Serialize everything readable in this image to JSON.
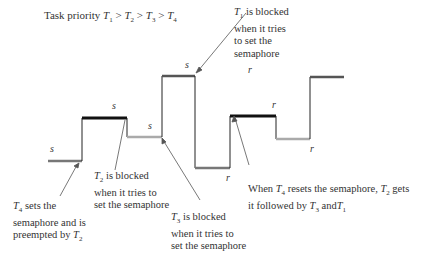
{
  "title": "Task priority T1 > T2 > T3 > T4",
  "colors": {
    "T1": "#555555",
    "T2": "#111111",
    "T3": "#aaaaaa",
    "T4": "#777777",
    "line": "#222222"
  },
  "segments": [
    {
      "task": "T4",
      "x1": 48,
      "x2": 82,
      "y": 161,
      "label": "s",
      "lx": 50,
      "ly": 143
    },
    {
      "task": "T2",
      "x1": 82,
      "x2": 127,
      "y": 118,
      "label": "s",
      "lx": 112,
      "ly": 100
    },
    {
      "task": "T3",
      "x1": 127,
      "x2": 162,
      "y": 137,
      "label": "s",
      "lx": 148,
      "ly": 120
    },
    {
      "task": "T1",
      "x1": 162,
      "x2": 195,
      "y": 76,
      "label": "s",
      "lx": 185,
      "ly": 59
    },
    {
      "task": "T4",
      "x1": 195,
      "x2": 230,
      "y": 168,
      "label": "r",
      "lx": 226,
      "ly": 172
    },
    {
      "task": "T2",
      "x1": 230,
      "x2": 276,
      "y": 116,
      "label": "r",
      "lx": 272,
      "ly": 99
    },
    {
      "task": "T3",
      "x1": 276,
      "x2": 310,
      "y": 139,
      "label": "r",
      "lx": 310,
      "ly": 143
    },
    {
      "task": "T1",
      "x1": 310,
      "x2": 344,
      "y": 77,
      "label": "r",
      "lx": 248,
      "ly": 64
    }
  ],
  "annotations": {
    "t1_blocked": [
      "is blocked",
      "when it tries",
      "to set the",
      "semaphore"
    ],
    "t2_blocked": [
      "is blocked",
      "when it tries to",
      "set the semaphore"
    ],
    "t3_blocked": [
      "is blocked",
      "when it tries to",
      "set the semaphore"
    ],
    "t4_sets": [
      "sets the",
      "semaphore and is",
      "preempted by"
    ],
    "t4_resets": [
      "When",
      "resets the semaphore,",
      "gets",
      "it followed by",
      "and"
    ]
  }
}
